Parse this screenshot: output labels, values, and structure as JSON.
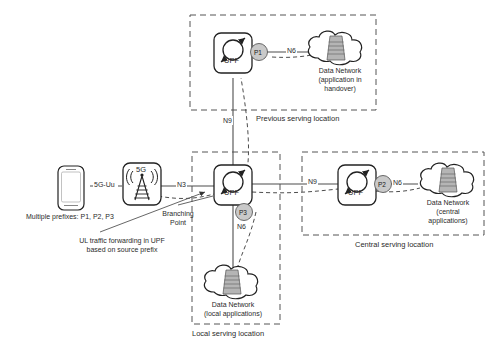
{
  "diagram": {
    "colors": {
      "line": "#4d4d4d",
      "badge_fill": "#c9c9c9",
      "badge_stroke": "#5a5a5a",
      "server_fill": "#b5b5b5",
      "region_border": "#555555",
      "text": "#2b2b2b"
    },
    "regions": [
      {
        "id": "previous",
        "caption": "Previous serving location"
      },
      {
        "id": "central",
        "caption": "Central serving location"
      },
      {
        "id": "local",
        "caption": "Local serving location"
      }
    ],
    "nodes": {
      "ue": {
        "label": "",
        "icon": "smartphone-icon"
      },
      "gnb": {
        "label": "5G",
        "icon": "base-station-icon"
      },
      "upf_branching": {
        "label": "UPF",
        "icon": "upf-icon"
      },
      "upf_previous": {
        "label": "UPF",
        "icon": "upf-icon"
      },
      "upf_central": {
        "label": "UPF",
        "icon": "upf-icon"
      },
      "dn_handover": {
        "line1": "Data Network",
        "line2": "(application in",
        "line3": "handover)",
        "icon": "cloud-datacenter-icon"
      },
      "dn_central": {
        "line1": "Data Network",
        "line2": "(central",
        "line3": "applications)",
        "icon": "cloud-datacenter-icon"
      },
      "dn_local": {
        "line1": "Data Network",
        "line2": "(local applications)",
        "line3": "",
        "icon": "cloud-datacenter-icon"
      }
    },
    "badges": {
      "p1": "P1",
      "p2": "P2",
      "p3": "P3"
    },
    "interfaces": {
      "uu": "5G-Uu",
      "n3": "N3",
      "n9_up": "N9",
      "n9_right": "N9",
      "n6_previous": "N6",
      "n6_central": "N6",
      "n6_local": "N6"
    },
    "annotations": {
      "prefixes": "Multiple prefixes: P1, P2, P3",
      "branching_point_l1": "Branching",
      "branching_point_l2": "Point",
      "ul_note_l1": "UL traffic forwarding in UPF",
      "ul_note_l2": "based on source prefix"
    }
  }
}
